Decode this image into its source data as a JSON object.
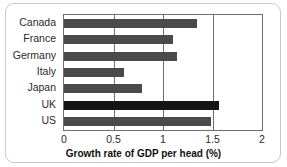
{
  "chart_data": {
    "type": "bar",
    "orientation": "horizontal",
    "title": "",
    "xlabel": "Growth rate of GDP per head (%)",
    "ylabel": "",
    "categories": [
      "Canada",
      "France",
      "Germany",
      "Italy",
      "Japan",
      "UK",
      "US"
    ],
    "values": [
      1.34,
      1.1,
      1.14,
      0.61,
      0.79,
      1.57,
      1.48
    ],
    "xlim": [
      0,
      2
    ],
    "xticks": [
      "0",
      "0.5",
      "1",
      "1.5",
      "2"
    ],
    "xtick_values": [
      0,
      0.5,
      1,
      1.5,
      2
    ],
    "grid": "vertical",
    "legend": "none",
    "highlight_category": "UK",
    "colors": {
      "bar": "#4a4a4a",
      "bar_highlight": "#141414",
      "axis": "#6e6e6e",
      "frame": "#c8c8c8",
      "text": "#2b2b2b",
      "background": "#ffffff"
    }
  }
}
